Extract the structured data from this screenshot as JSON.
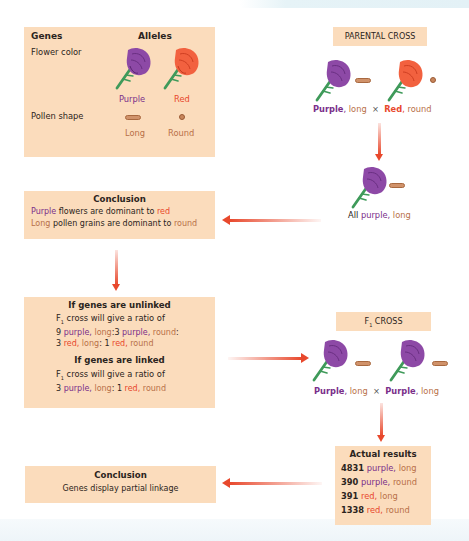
{
  "colors": {
    "box_fill": "#fbdcbc",
    "purple": "#7a2f8a",
    "red": "#e8482c",
    "tan": "#b87048",
    "arrow": "#e8482c",
    "stem": "#3f9a5a"
  },
  "alleles_box": {
    "genes_header": "Genes",
    "alleles_header": "Alleles",
    "flower_color_label": "Flower color",
    "purple_label": "Purple",
    "red_label": "Red",
    "pollen_shape_label": "Pollen shape",
    "long_label": "Long",
    "round_label": "Round"
  },
  "parental_cross": {
    "title": "PARENTAL CROSS",
    "parent1": {
      "color": "Purple",
      "sep": ",",
      "shape": "long"
    },
    "cross_symbol": "×",
    "parent2": {
      "color": "Red",
      "sep": ",",
      "shape": "round"
    },
    "offspring": {
      "prefix": "All",
      "color": "purple",
      "sep": ",",
      "shape": "long"
    }
  },
  "conclusion_1": {
    "title": "Conclusion",
    "line1": {
      "a": "Purple",
      "b": " flowers are dominant to ",
      "c": "red"
    },
    "line2": {
      "a": "Long",
      "b": " pollen grains are dominant to ",
      "c": "round"
    }
  },
  "predictions": {
    "unlinked_title": "If genes are unlinked",
    "unlinked_text_prefix": "F",
    "unlinked_text_sub": "1",
    "unlinked_text_rest": " cross will give a ratio of",
    "unlinked_ratio_line1": {
      "n1": "9",
      "c1": "purple",
      "s1": "long",
      "sep1": ":",
      "n2": "3",
      "c2": "purple",
      "s2": "round",
      "end": ":"
    },
    "unlinked_ratio_line2": {
      "n1": "3",
      "c1": "red",
      "s1": "long",
      "sep1": ":",
      "n2": "1",
      "c2": "red",
      "s2": "round"
    },
    "linked_title": "If genes are linked",
    "linked_text_prefix": "F",
    "linked_text_sub": "1",
    "linked_text_rest": " cross will give a ratio of",
    "linked_ratio": {
      "n1": "3",
      "c1": "purple",
      "s1": "long",
      "sep1": ":",
      "n2": "1",
      "c2": "red",
      "s2": "round"
    }
  },
  "f1_cross": {
    "title_prefix": "F",
    "title_sub": "1",
    "title_rest": " CROSS",
    "parent1": {
      "color": "Purple",
      "sep": ",",
      "shape": "long"
    },
    "cross_symbol": "×",
    "parent2": {
      "color": "Purple",
      "sep": ",",
      "shape": "long"
    }
  },
  "actual_results": {
    "title": "Actual results",
    "rows": [
      {
        "count": "4831",
        "color": "purple",
        "shape": "long"
      },
      {
        "count": "390",
        "color": "purple",
        "shape": "round"
      },
      {
        "count": "391",
        "color": "red",
        "shape": "long"
      },
      {
        "count": "1338",
        "color": "red",
        "shape": "round"
      }
    ]
  },
  "conclusion_2": {
    "title": "Conclusion",
    "text": "Genes display partial linkage"
  },
  "icons": {
    "purple_flower": "purple-flower-icon",
    "red_flower": "red-flower-icon",
    "long_pollen": "long-pollen-icon",
    "round_pollen": "round-pollen-icon",
    "arrow": "arrow-icon"
  }
}
